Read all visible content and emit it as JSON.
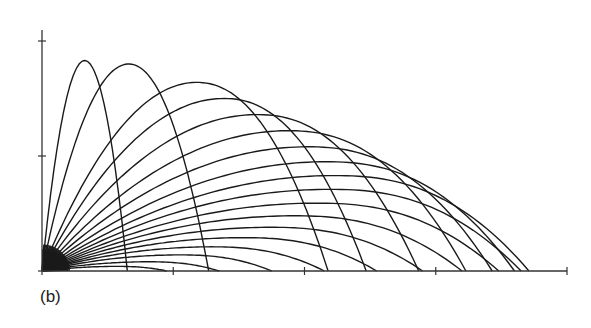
{
  "caption": "(b)",
  "colors": {
    "line": "#1a1a1a",
    "axis": "#333333",
    "background": "#ffffff"
  },
  "chart_data": {
    "type": "line",
    "title": "",
    "xlabel": "",
    "ylabel": "",
    "note": "Family of projectile trajectories launched from the origin at varying angles; axes have tick marks but no numeric labels (values in tick units, estimated).",
    "xlim": [
      0,
      4
    ],
    "ylim": [
      0,
      2
    ],
    "x_ticks": [
      0,
      1,
      2,
      3,
      4
    ],
    "y_ticks": [
      0,
      1,
      2
    ],
    "tick_labels_shown": false,
    "grid": false,
    "legend": null,
    "series": [
      {
        "name": "trajectory-1",
        "range": 0.65,
        "peak_height": 1.83,
        "peak_x_frac": 0.5
      },
      {
        "name": "trajectory-2",
        "range": 1.27,
        "peak_height": 1.8,
        "peak_x_frac": 0.52
      },
      {
        "name": "trajectory-3",
        "range": 2.18,
        "peak_height": 1.64,
        "peak_x_frac": 0.54
      },
      {
        "name": "trajectory-4",
        "range": 2.47,
        "peak_height": 1.5,
        "peak_x_frac": 0.56
      },
      {
        "name": "trajectory-5",
        "range": 2.87,
        "peak_height": 1.36,
        "peak_x_frac": 0.57
      },
      {
        "name": "trajectory-6",
        "range": 3.23,
        "peak_height": 1.22,
        "peak_x_frac": 0.58
      },
      {
        "name": "trajectory-7",
        "range": 3.43,
        "peak_height": 1.08,
        "peak_x_frac": 0.59
      },
      {
        "name": "trajectory-8",
        "range": 3.6,
        "peak_height": 0.95,
        "peak_x_frac": 0.6
      },
      {
        "name": "trajectory-9",
        "range": 3.71,
        "peak_height": 0.83,
        "peak_x_frac": 0.6
      },
      {
        "name": "trajectory-10",
        "range": 3.65,
        "peak_height": 0.71,
        "peak_x_frac": 0.6
      },
      {
        "name": "trajectory-11",
        "range": 3.48,
        "peak_height": 0.59,
        "peak_x_frac": 0.6
      },
      {
        "name": "trajectory-12",
        "range": 3.2,
        "peak_height": 0.48,
        "peak_x_frac": 0.6
      },
      {
        "name": "trajectory-13",
        "range": 2.9,
        "peak_height": 0.38,
        "peak_x_frac": 0.6
      },
      {
        "name": "trajectory-14",
        "range": 2.55,
        "peak_height": 0.29,
        "peak_x_frac": 0.6
      },
      {
        "name": "trajectory-15",
        "range": 2.15,
        "peak_height": 0.21,
        "peak_x_frac": 0.6
      },
      {
        "name": "trajectory-16",
        "range": 1.75,
        "peak_height": 0.14,
        "peak_x_frac": 0.6
      },
      {
        "name": "trajectory-17",
        "range": 1.35,
        "peak_height": 0.08,
        "peak_x_frac": 0.6
      },
      {
        "name": "trajectory-18",
        "range": 0.95,
        "peak_height": 0.04,
        "peak_x_frac": 0.6
      }
    ]
  },
  "layout": {
    "origin_px": [
      42,
      271
    ],
    "x_unit_px": 131.25,
    "y_unit_px": 115,
    "x_axis_end_px": 567,
    "y_axis_top_px": 30
  }
}
